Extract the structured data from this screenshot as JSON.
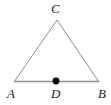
{
  "figure": {
    "type": "geometry-diagram",
    "background_color": "#ffffff",
    "stroke_color": "#8c8c8c",
    "point_color": "#000000",
    "label_color": "#1a1a1a",
    "stroke_width": 1,
    "point_radius": 3,
    "labels": {
      "apex": "C",
      "bottom_left": "A",
      "bottom_middle": "D",
      "bottom_right": "B"
    },
    "points": {
      "C": {
        "x": 57,
        "y": 20
      },
      "A": {
        "x": 14,
        "y": 82
      },
      "B": {
        "x": 99,
        "y": 82
      },
      "D": {
        "x": 56,
        "y": 81
      }
    }
  }
}
